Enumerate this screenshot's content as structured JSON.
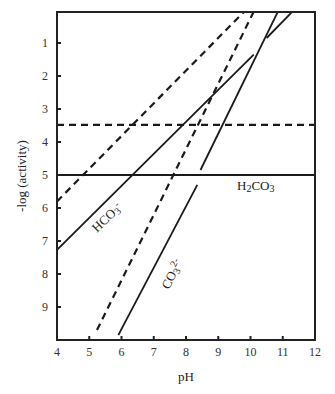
{
  "chart_data": {
    "type": "line",
    "title": "",
    "xlabel": "pH",
    "ylabel": "-log (activity)",
    "xlim": [
      4,
      12
    ],
    "ylim": [
      10,
      0
    ],
    "y_inverted": true,
    "grid": false,
    "legend": null,
    "x_ticks": [
      "4",
      "5",
      "6",
      "7",
      "8",
      "9",
      "10",
      "11",
      "12"
    ],
    "y_ticks": [
      "1",
      "2",
      "3",
      "4",
      "5",
      "6",
      "7",
      "8",
      "9"
    ],
    "annotations": [
      {
        "text": "H2CO3",
        "x": 10.1,
        "y": 5.45,
        "rotation": 0
      },
      {
        "text": "HCO3-",
        "x": 5.2,
        "y": 6.1,
        "rotation": -44
      },
      {
        "text": "CO32-",
        "x": 7.6,
        "y": 8.1,
        "rotation": -62
      }
    ],
    "series": [
      {
        "name": "H2CO3",
        "style": "solid",
        "points": [
          [
            4,
            5.0
          ],
          [
            12,
            5.0
          ]
        ]
      },
      {
        "name": "H2CO3 (dashed)",
        "style": "dashed",
        "points": [
          [
            4,
            3.48
          ],
          [
            12,
            3.48
          ]
        ]
      },
      {
        "name": "HCO3-",
        "style": "solid",
        "points": [
          [
            4,
            7.27
          ],
          [
            10.1,
            1.35
          ]
        ]
      },
      {
        "name": "HCO3- (upper segment)",
        "style": "solid",
        "points": [
          [
            10.5,
            0.85
          ],
          [
            11.3,
            0.05
          ]
        ]
      },
      {
        "name": "HCO3- (dashed)",
        "style": "dashed",
        "points": [
          [
            4,
            5.8
          ],
          [
            9.8,
            0.05
          ]
        ]
      },
      {
        "name": "CO32-",
        "style": "solid",
        "points": [
          [
            5.9,
            9.85
          ],
          [
            8.35,
            5.3
          ]
        ]
      },
      {
        "name": "CO32- (upper segment)",
        "style": "solid",
        "points": [
          [
            8.45,
            4.85
          ],
          [
            10.85,
            0.05
          ]
        ]
      },
      {
        "name": "CO32- (dashed)",
        "style": "dashed",
        "points": [
          [
            5.24,
            9.7
          ],
          [
            10.1,
            0.05
          ]
        ]
      }
    ]
  },
  "labels": {
    "xlabel": "pH",
    "ylabel": "-log (activity)",
    "h2co3_main": "H",
    "h2co3_sub": "2",
    "h2co3_rest": "CO",
    "h2co3_sub2": "3",
    "hco3_main": "HCO",
    "hco3_sub": "3",
    "hco3_sup": "-",
    "co3_main": "CO",
    "co3_sub": "3",
    "co3_sup": "2-"
  }
}
